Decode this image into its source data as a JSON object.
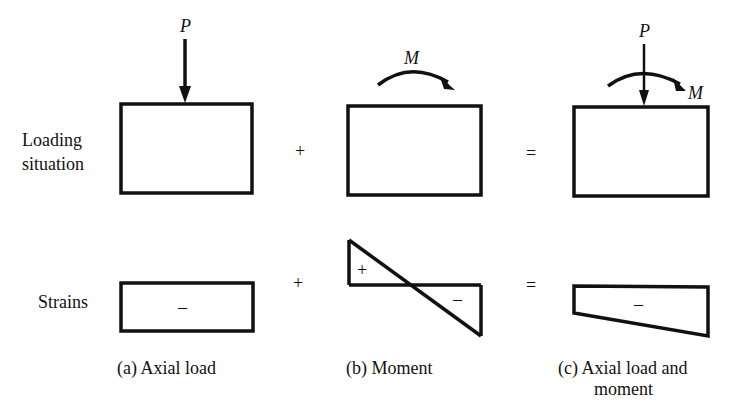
{
  "row_labels": {
    "loading_line1": "Loading",
    "loading_line2": "situation",
    "strains": "Strains"
  },
  "operators": {
    "plus": "+",
    "equals": "="
  },
  "symbols": {
    "force": "P",
    "moment": "M"
  },
  "strain_signs": {
    "positive": "+",
    "negative": "–"
  },
  "captions": {
    "a": "(a)  Axial load",
    "b": "(b)  Moment",
    "c_line1": "(c)  Axial load and",
    "c_line2": "moment"
  },
  "colors": {
    "ink": "#111111",
    "background": "#ffffff"
  }
}
